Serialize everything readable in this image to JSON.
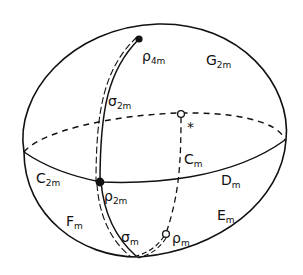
{
  "diagram": {
    "type": "sphere-with-arcs",
    "colors": {
      "ink": "#111111",
      "background": "#ffffff"
    },
    "labels": {
      "rho_4m": {
        "main": "ρ",
        "sub": "4m"
      },
      "G_2m": {
        "main": "G",
        "sub": "2m"
      },
      "sigma_2m": {
        "main": "σ",
        "sub": "2m"
      },
      "star": {
        "main": "*"
      },
      "C_m": {
        "main": "C",
        "sub": "m"
      },
      "C_2m": {
        "main": "C",
        "sub": "2m"
      },
      "D_m": {
        "main": "D",
        "sub": "m"
      },
      "rho_2m": {
        "main": "ρ",
        "sub": "2m"
      },
      "F_m": {
        "main": "F",
        "sub": "m"
      },
      "E_m": {
        "main": "E",
        "sub": "m"
      },
      "sigma_m": {
        "main": "σ",
        "sub": "m"
      },
      "rho_m": {
        "main": "ρ",
        "sub": "m"
      }
    },
    "points": [
      {
        "id": "rho_4m",
        "style": "filled"
      },
      {
        "id": "rho_2m",
        "style": "filled"
      },
      {
        "id": "rho_m",
        "style": "hollow"
      },
      {
        "id": "star-point",
        "style": "hollow"
      }
    ],
    "curves": [
      {
        "id": "sphere-outline",
        "style": "solid"
      },
      {
        "id": "equator-front",
        "style": "solid"
      },
      {
        "id": "equator-back",
        "style": "dashed"
      },
      {
        "id": "sigma_2m-arc",
        "style": "double (solid + dashed)"
      },
      {
        "id": "sigma_m-arc",
        "style": "double (solid + dashed)"
      },
      {
        "id": "C_m-arc",
        "style": "dashed"
      }
    ]
  }
}
